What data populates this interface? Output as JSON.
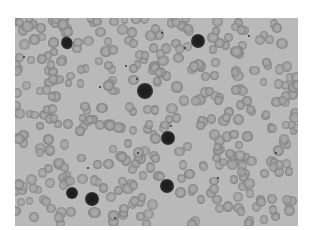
{
  "image": {
    "description": "Grayscale light micrograph of a blood smear showing many red blood cells and several dark-stained nucleated cells",
    "colors": {
      "background": "#b9b9b9",
      "page": "#ffffff"
    },
    "dark_cells": [
      {
        "x": 52,
        "y": 25,
        "r": 6,
        "irregular": true
      },
      {
        "x": 183,
        "y": 23,
        "r": 7
      },
      {
        "x": 130,
        "y": 73,
        "r": 8
      },
      {
        "x": 153,
        "y": 120,
        "r": 7
      },
      {
        "x": 152,
        "y": 168,
        "r": 7
      },
      {
        "x": 57,
        "y": 175,
        "r": 6
      },
      {
        "x": 77,
        "y": 181,
        "r": 7
      }
    ]
  }
}
